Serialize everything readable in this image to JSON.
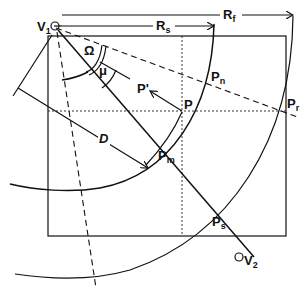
{
  "diagram": {
    "labels": {
      "v1": "V",
      "v1_sub": "1",
      "v2": "V",
      "v2_sub": "2",
      "rs": "R",
      "rs_sub": "s",
      "rf": "R",
      "rf_sub": "f",
      "omega": "Ω",
      "mu": "μ",
      "p_prime": "P'",
      "p": "P",
      "pn": "P",
      "pn_sub": "n",
      "pr": "P",
      "pr_sub": "r",
      "pm": "P",
      "pm_sub": "m",
      "ps": "P",
      "ps_sub": "s",
      "d": "D"
    },
    "colors": {
      "ink": "#111111",
      "background": "#ffffff"
    }
  }
}
